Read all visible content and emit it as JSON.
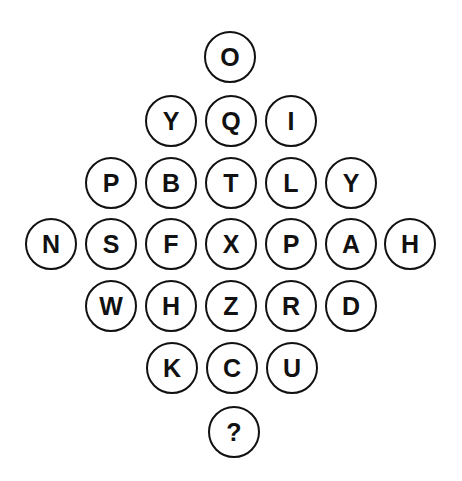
{
  "puzzle": {
    "rows": [
      [
        "O"
      ],
      [
        "Y",
        "Q",
        "I"
      ],
      [
        "P",
        "B",
        "T",
        "L",
        "Y"
      ],
      [
        "N",
        "S",
        "F",
        "X",
        "P",
        "A",
        "H"
      ],
      [
        "W",
        "H",
        "Z",
        "R",
        "D"
      ],
      [
        "K",
        "C",
        "U"
      ],
      [
        "?"
      ]
    ],
    "cells": [
      {
        "label": "O",
        "cx": 230,
        "cy": 57
      },
      {
        "label": "Y",
        "cx": 171,
        "cy": 121
      },
      {
        "label": "Q",
        "cx": 231,
        "cy": 121
      },
      {
        "label": "I",
        "cx": 291,
        "cy": 121
      },
      {
        "label": "P",
        "cx": 111,
        "cy": 183
      },
      {
        "label": "B",
        "cx": 171,
        "cy": 183
      },
      {
        "label": "T",
        "cx": 231,
        "cy": 183
      },
      {
        "label": "L",
        "cx": 291,
        "cy": 183
      },
      {
        "label": "Y",
        "cx": 351,
        "cy": 183
      },
      {
        "label": "N",
        "cx": 51,
        "cy": 244
      },
      {
        "label": "S",
        "cx": 111,
        "cy": 244
      },
      {
        "label": "F",
        "cx": 171,
        "cy": 244
      },
      {
        "label": "X",
        "cx": 231,
        "cy": 244
      },
      {
        "label": "P",
        "cx": 291,
        "cy": 244
      },
      {
        "label": "A",
        "cx": 351,
        "cy": 244
      },
      {
        "label": "H",
        "cx": 410,
        "cy": 244
      },
      {
        "label": "W",
        "cx": 111,
        "cy": 306
      },
      {
        "label": "H",
        "cx": 171,
        "cy": 306
      },
      {
        "label": "Z",
        "cx": 231,
        "cy": 306
      },
      {
        "label": "R",
        "cx": 291,
        "cy": 306
      },
      {
        "label": "D",
        "cx": 351,
        "cy": 306
      },
      {
        "label": "K",
        "cx": 172,
        "cy": 368
      },
      {
        "label": "C",
        "cx": 232,
        "cy": 368
      },
      {
        "label": "U",
        "cx": 292,
        "cy": 368
      },
      {
        "label": "?",
        "cx": 234,
        "cy": 432
      }
    ],
    "colors": {
      "stroke": "#111111",
      "text": "#111111",
      "background": "#ffffff"
    }
  }
}
